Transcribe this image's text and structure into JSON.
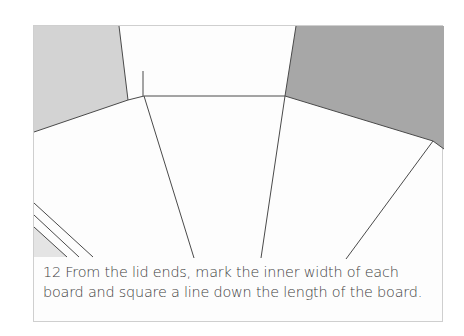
{
  "figure": {
    "step_number": "12",
    "caption_line1": "12 From the lid ends, mark the inner width of each",
    "caption_line2": "board and square a line down the length of the board.",
    "colors": {
      "frame": "#cfcfcf",
      "left_shade": "#d3d3d3",
      "right_shade": "#a7a7a7",
      "bottom_left_shade": "#e4e4e4",
      "line": "#4a4a4a",
      "text": "#3e3e3e"
    }
  }
}
